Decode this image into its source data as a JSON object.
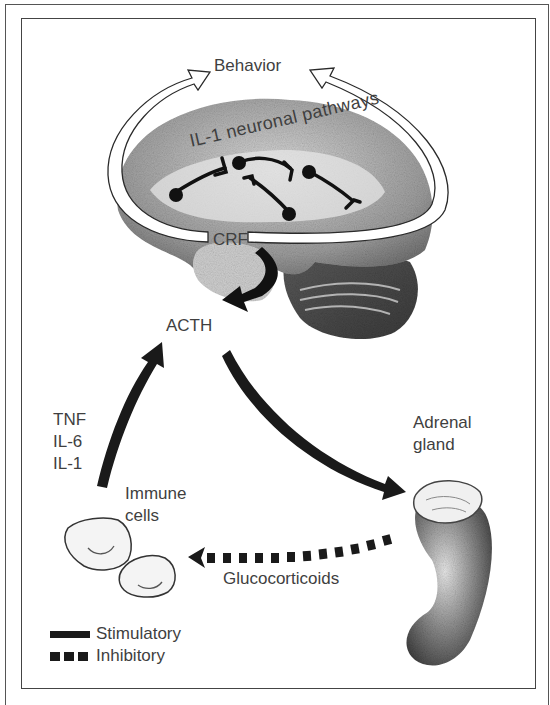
{
  "diagram": {
    "labels": {
      "behavior": "Behavior",
      "pathways": "IL-1 neuronal pathways",
      "crf": "CRF",
      "acth": "ACTH",
      "cytokines": [
        "TNF",
        "IL-6",
        "IL-1"
      ],
      "immune_cells": [
        "Immune",
        "cells"
      ],
      "adrenal_gland": [
        "Adrenal",
        "gland"
      ],
      "glucocorticoids": "Glucocorticoids"
    },
    "legend": {
      "stimulatory": "Stimulatory",
      "inhibitory": "Inhibitory"
    },
    "colors": {
      "arrow": "#1a1a1a",
      "text": "#3f3f3f",
      "frame": "#444444"
    }
  }
}
